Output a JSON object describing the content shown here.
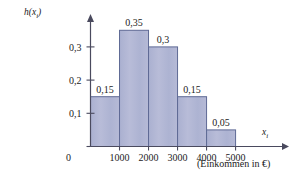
{
  "chart_data": {
    "type": "bar",
    "title": "",
    "subtitle": "",
    "xlabel": "x_i",
    "ylabel": "h(x_i)",
    "xlabel_display": "x",
    "xlabel_sub": "i",
    "ylabel_display": "h(x",
    "ylabel_sub": "i",
    "ylabel_close": ")",
    "x_caption": "(Einkommen in €)",
    "categories": [
      "0–1000",
      "1000–2000",
      "2000–3000",
      "3000–4000",
      "4000–5000"
    ],
    "bin_edges": [
      0,
      1000,
      2000,
      3000,
      4000,
      5000
    ],
    "values": [
      0.15,
      0.35,
      0.3,
      0.15,
      0.05
    ],
    "value_labels": [
      "0,15",
      "0,35",
      "0,3",
      "0,15",
      "0,05"
    ],
    "xtick_values": [
      0,
      1000,
      2000,
      3000,
      4000,
      5000
    ],
    "xtick_labels": [
      "0",
      "1000",
      "2000",
      "3000",
      "4000",
      "5000"
    ],
    "ytick_values": [
      0.1,
      0.2,
      0.3
    ],
    "ytick_labels": [
      "0,1",
      "0,2",
      "0,3"
    ],
    "xlim": [
      0,
      6600
    ],
    "ylim": [
      0,
      0.375
    ],
    "grid": false,
    "legend": null,
    "colors": {
      "bar_fill": "#b2b7d4",
      "bar_stroke": "#5f6a95",
      "axis": "#4a4a5e",
      "text": "#1b1b1b",
      "background": "#ffffff"
    }
  }
}
